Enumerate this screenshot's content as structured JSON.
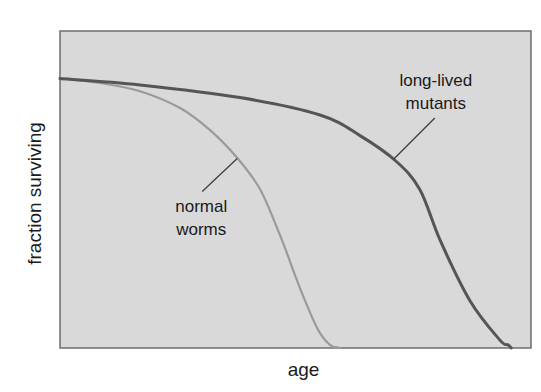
{
  "chart_data": {
    "type": "line",
    "title": "",
    "xlabel": "age",
    "ylabel": "fraction surviving",
    "xlim": [
      0,
      100
    ],
    "ylim": [
      0,
      1
    ],
    "grid": false,
    "legend": "none",
    "x_ticks": [],
    "y_ticks": [],
    "background_color": "#d9d9d9",
    "series": [
      {
        "name": "normal worms",
        "color": "#9a9a9a",
        "x": [
          0,
          8.5,
          17,
          25.5,
          31.8,
          37.6,
          42.5,
          46.7,
          49.9,
          52,
          54.8,
          57.3,
          59.4
        ],
        "y": [
          0.85,
          0.836,
          0.81,
          0.757,
          0.688,
          0.6,
          0.5,
          0.356,
          0.23,
          0.15,
          0.057,
          0.01,
          0
        ]
      },
      {
        "name": "long-lived mutants",
        "color": "#555555",
        "x": [
          0,
          17,
          38.2,
          55.2,
          63.7,
          71.3,
          76.4,
          80.7,
          87,
          93.4,
          95.1,
          95.8
        ],
        "y": [
          0.85,
          0.83,
          0.79,
          0.735,
          0.67,
          0.59,
          0.5,
          0.34,
          0.15,
          0.025,
          0.01,
          0
        ]
      }
    ],
    "annotations": [
      {
        "series": "normal worms",
        "lines": [
          "normal",
          "worms"
        ],
        "points_to": {
          "x": 37.2,
          "y": 0.604
        }
      },
      {
        "series": "long-lived mutants",
        "lines": [
          "long-lived",
          "mutants"
        ],
        "points_to": {
          "x": 71.3,
          "y": 0.59
        }
      }
    ]
  }
}
